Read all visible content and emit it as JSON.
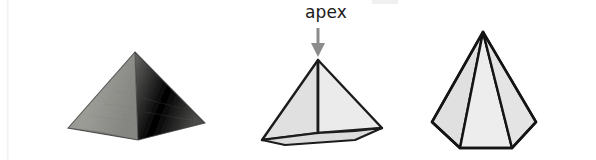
{
  "page": {
    "width": 596,
    "height": 160,
    "background_color": "#ffffff"
  },
  "annotation": {
    "apex_label": "apex",
    "apex_label_color": "#1a1a1a",
    "arrow_color": "#8c8c8c",
    "arrow_direction": "down"
  },
  "figures": [
    {
      "id": "photograph",
      "name": "pyramid-photograph",
      "kind": "photo",
      "subject": "great pyramid of giza",
      "shape": "square pyramid",
      "description": "grayscale photograph of a stone pyramid",
      "colors": {
        "left_face": "#9a9a96",
        "right_face": "#5f5f5d",
        "left_face_shadow": "#7d7d7a",
        "outline": "#3a3a38"
      },
      "geometry": {
        "apex": [
          105,
          24
        ],
        "base_left": [
          38,
          100
        ],
        "base_right": [
          175,
          95
        ],
        "base_front": [
          108,
          112
        ]
      }
    },
    {
      "id": "square-pyramid",
      "name": "square-pyramid-diagram",
      "kind": "line-diagram",
      "shape": "square pyramid",
      "base_sides": 4,
      "visible_lateral_faces": 2,
      "hidden_edges_style": "dashed",
      "colors": {
        "face_left": "#e0e0e0",
        "face_right": "#ebebeb",
        "face_base_strip": "#dedede",
        "outline": "#1c1c1c",
        "hidden_edge": "#4a4a4a"
      },
      "geometry": {
        "apex": [
          73,
          60
        ],
        "base_front_left": [
          17,
          140
        ],
        "base_front_right": [
          110,
          131
        ],
        "base_back_left": [
          40,
          112
        ],
        "base_back_right": [
          137,
          128
        ]
      }
    },
    {
      "id": "hexagonal-pyramid",
      "name": "hexagonal-pyramid-diagram",
      "kind": "line-diagram",
      "shape": "hexagonal pyramid",
      "base_sides": 6,
      "visible_lateral_faces": 3,
      "hidden_edges_style": "dashed",
      "colors": {
        "face_light": "#e9e9e9",
        "face_mid": "#e2e2e2",
        "face_dark": "#d9d9d9",
        "outline": "#141414",
        "hidden_edge": "#4a4a4a"
      },
      "geometry": {
        "apex": [
          68,
          22
        ],
        "base_left": [
          17,
          112
        ],
        "base_front_left": [
          45,
          138
        ],
        "base_front_right": [
          97,
          138
        ],
        "base_right": [
          121,
          112
        ],
        "base_back_right": [
          100,
          92
        ],
        "base_back_left": [
          40,
          92
        ]
      }
    }
  ]
}
